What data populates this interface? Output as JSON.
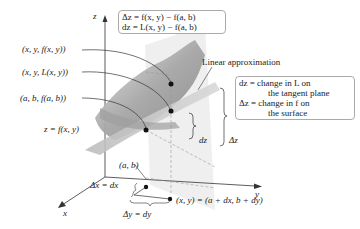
{
  "diagram": {
    "type": "3d-surface-linear-approximation",
    "axes": {
      "z_label": "z",
      "y_label": "y",
      "x_label": "x"
    },
    "top_box": {
      "line1": "Δz = f(x, y) − f(a, b)",
      "line2": "dz = L(x, y) − f(a, b)"
    },
    "right_box": {
      "line1": "dz = change in L on",
      "line2": "the tangent plane",
      "line3": "Δz = change in f on",
      "line4": "the surface"
    },
    "labels": {
      "point_surface": "(x, y, f(x, y))",
      "point_plane": "(x, y, L(x, y))",
      "point_base": "(a, b, f(a, b))",
      "surface": "z = f(x, y)",
      "linear_approx": "Linear approximation",
      "ab": "(a, b)",
      "delta_x": "Δx = dx",
      "delta_y": "Δy = dy",
      "xy_point": "(x, y) = (a + dx, b + dy)",
      "dz": "dz",
      "Dz": "Δz"
    },
    "colors": {
      "surface": "#9a9a9a",
      "plane": "#cfcfcf",
      "vertical_plane": "#ececec",
      "box_border": "#aaaaaa"
    }
  }
}
